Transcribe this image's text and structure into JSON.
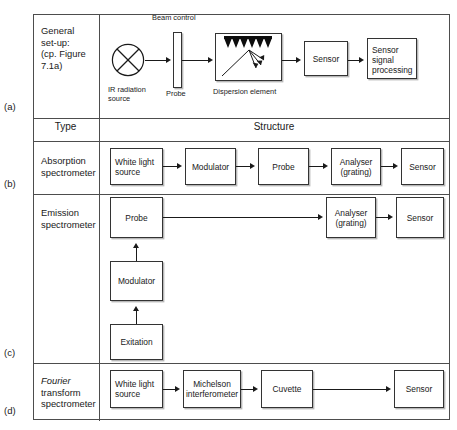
{
  "figure": {
    "row_letters": [
      "(a)",
      "(b)",
      "(c)",
      "(d)"
    ],
    "header": {
      "type_label": "Type",
      "structure_label": "Structure"
    },
    "rows": [
      {
        "letter": "(a)",
        "type": "General set-up: (cp. Figure 7.1a)",
        "type_lines": [
          "General",
          "set-up:",
          "(cp. Figure",
          "7.1a)"
        ],
        "captions": {
          "beam_control": "Beam control",
          "ir_source": "IR radiation source",
          "ir_source_line1": "IR radiation",
          "ir_source_line2": "source",
          "probe": "Probe",
          "dispersion": "Dispersion element"
        },
        "blocks": [
          {
            "name": "ir-radiation-source",
            "label": ""
          },
          {
            "name": "probe-slab",
            "label": ""
          },
          {
            "name": "dispersion-element",
            "label": ""
          },
          {
            "name": "sensor",
            "label": "Sensor"
          },
          {
            "name": "sensor-signal-processing",
            "label": "Sensor signal processing"
          }
        ]
      },
      {
        "letter": "(b)",
        "type_lines": [
          "Absorption",
          "spectrometer"
        ],
        "blocks": [
          {
            "name": "white-light-source",
            "label": "White light source"
          },
          {
            "name": "modulator",
            "label": "Modulator"
          },
          {
            "name": "probe",
            "label": "Probe"
          },
          {
            "name": "analyser-grating",
            "label": "Analyser (grating)"
          },
          {
            "name": "sensor",
            "label": "Sensor"
          }
        ]
      },
      {
        "letter": "(c)",
        "type_lines": [
          "Emission",
          "spectrometer"
        ],
        "blocks": [
          {
            "name": "probe",
            "label": "Probe"
          },
          {
            "name": "modulator",
            "label": "Modulator"
          },
          {
            "name": "exitation",
            "label": "Exitation"
          },
          {
            "name": "analyser-grating",
            "label": "Analyser (grating)"
          },
          {
            "name": "sensor",
            "label": "Sensor"
          }
        ]
      },
      {
        "letter": "(d)",
        "type_lines": [
          "Fourier",
          "transform",
          "spectrometer"
        ],
        "type_italic_word": "Fourier",
        "blocks": [
          {
            "name": "white-light-source",
            "label": "White light source"
          },
          {
            "name": "michelson-interferometer",
            "label": "Michelson interferometer"
          },
          {
            "name": "cuvette",
            "label": "Cuvette"
          },
          {
            "name": "sensor",
            "label": "Sensor"
          }
        ]
      }
    ],
    "labels": {
      "a_sensor": "Sensor",
      "a_sensor_signal_l1": "Sensor",
      "a_sensor_signal_l2": "signal",
      "a_sensor_signal_l3": "processing",
      "b_white_light_l1": "White light",
      "b_white_light_l2": "source",
      "b_modulator": "Modulator",
      "b_probe": "Probe",
      "b_analyser_l1": "Analyser",
      "b_analyser_l2": "(grating)",
      "b_sensor": "Sensor",
      "c_probe": "Probe",
      "c_modulator": "Modulator",
      "c_exitation": "Exitation",
      "c_analyser_l1": "Analyser",
      "c_analyser_l2": "(grating)",
      "c_sensor": "Sensor",
      "d_white_light_l1": "White light",
      "d_white_light_l2": "source",
      "d_michelson_l1": "Michelson",
      "d_michelson_l2": "interferometer",
      "d_cuvette": "Cuvette",
      "d_sensor": "Sensor"
    },
    "colors": {
      "line": "#1a1a1a",
      "table_rule": "#4d4d4d",
      "box_border": "#333333",
      "box_shadow": "#b8b8b8",
      "background": "#ffffff"
    }
  }
}
